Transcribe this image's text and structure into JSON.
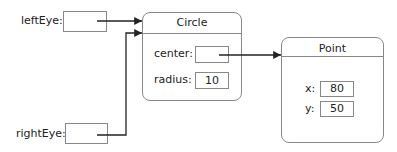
{
  "variables": [
    {
      "name": "leftEye",
      "label": "leftEye:",
      "value": ""
    },
    {
      "name": "rightEye",
      "label": "rightEye:",
      "value": ""
    }
  ],
  "objects": {
    "circle": {
      "title": "Circle",
      "fields": [
        {
          "label": "center:",
          "value": ""
        },
        {
          "label": "radius:",
          "value": "10"
        }
      ]
    },
    "point": {
      "title": "Point",
      "fields": [
        {
          "label": "x:",
          "value": "80"
        },
        {
          "label": "y:",
          "value": "50"
        }
      ]
    }
  },
  "colors": {
    "line": "#222222",
    "border": "#888888"
  }
}
